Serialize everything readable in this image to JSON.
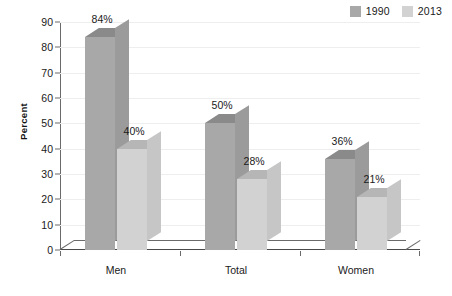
{
  "chart_data": {
    "type": "bar",
    "title": "",
    "xlabel": "",
    "ylabel": "Percent",
    "ylim": [
      0,
      90
    ],
    "ytick_step": 10,
    "yticks": [
      "90",
      "80",
      "70",
      "60",
      "50",
      "40",
      "30",
      "20",
      "10",
      "0"
    ],
    "grid": true,
    "legend_position": "top-right",
    "style": "3d-clustered-column",
    "categories": [
      "Men",
      "Total",
      "Women"
    ],
    "series": [
      {
        "name": "1990",
        "color": "#a8a8a8",
        "values": [
          84,
          50,
          36
        ],
        "labels": [
          "84%",
          "50%",
          "36%"
        ]
      },
      {
        "name": "2013",
        "color": "#d2d2d2",
        "values": [
          40,
          28,
          21
        ],
        "labels": [
          "40%",
          "28%",
          "21%"
        ]
      }
    ]
  },
  "legend": {
    "items": [
      {
        "label": "1990",
        "swatch_color": "#a8a8a8"
      },
      {
        "label": "2013",
        "swatch_color": "#d2d2d2"
      }
    ]
  },
  "axes": {
    "y_title": "Percent",
    "y_ticks": [
      "90",
      "80",
      "70",
      "60",
      "50",
      "40",
      "30",
      "20",
      "10",
      "0"
    ],
    "x_ticks": [
      "Men",
      "Total",
      "Women"
    ]
  },
  "colors": {
    "series_1990_front": "#a8a8a8",
    "series_1990_top": "#8a8a8a",
    "series_1990_side": "#9b9b9b",
    "series_2013_front": "#d2d2d2",
    "series_2013_top": "#b6b6b6",
    "series_2013_side": "#c6c6c6",
    "axis": "#6a6a6a",
    "grid": "#eeeeee",
    "text": "#1a1a1a",
    "background": "#ffffff"
  }
}
